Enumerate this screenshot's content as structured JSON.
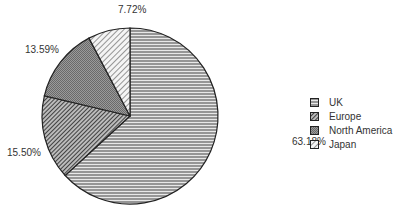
{
  "chart_data": {
    "type": "pie",
    "title": "",
    "start_angle": "12 o'clock, clockwise",
    "categories": [
      "UK",
      "Europe",
      "North America",
      "Japan"
    ],
    "values": [
      63.18,
      15.5,
      13.59,
      7.72
    ],
    "labels": [
      "63.18%",
      "15.50%",
      "13.59%",
      "7.72%"
    ],
    "patterns": [
      "horizontal-lines",
      "dense-diagonal-dark",
      "crosshatch-gray",
      "diagonal-light"
    ],
    "legend_position": "right"
  },
  "legend": {
    "items": [
      {
        "label": "UK"
      },
      {
        "label": "Europe"
      },
      {
        "label": "North America"
      },
      {
        "label": "Japan"
      }
    ]
  },
  "slice_labels": {
    "uk": "63.18%",
    "europe": "15.50%",
    "north_america": "13.59%",
    "japan": "7.72%"
  }
}
